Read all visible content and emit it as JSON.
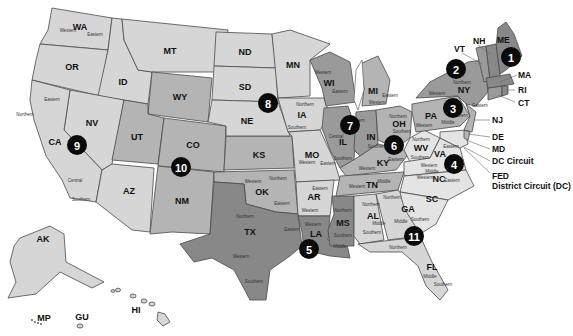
{
  "map": {
    "title": "United States Federal Judicial Circuits",
    "colors": {
      "light": "#d6d6d6",
      "mid": "#b4b4b4",
      "dark": "#9a9a9a",
      "darker": "#888888",
      "badge": "#0a0a0a",
      "background": "#ffffff"
    },
    "circuits": [
      {
        "number": "1",
        "states": [
          "ME",
          "NH",
          "MA",
          "RI"
        ]
      },
      {
        "number": "2",
        "states": [
          "VT",
          "NY",
          "CT"
        ]
      },
      {
        "number": "3",
        "states": [
          "PA",
          "NJ",
          "DE"
        ]
      },
      {
        "number": "4",
        "states": [
          "WV",
          "VA",
          "MD",
          "NC",
          "SC"
        ]
      },
      {
        "number": "5",
        "states": [
          "TX",
          "LA",
          "MS"
        ]
      },
      {
        "number": "6",
        "states": [
          "MI",
          "OH",
          "KY",
          "TN"
        ]
      },
      {
        "number": "7",
        "states": [
          "WI",
          "IL",
          "IN"
        ]
      },
      {
        "number": "8",
        "states": [
          "ND",
          "SD",
          "NE",
          "MN",
          "IA",
          "MO",
          "AR"
        ]
      },
      {
        "number": "9",
        "states": [
          "WA",
          "OR",
          "ID",
          "MT",
          "NV",
          "CA",
          "AZ",
          "AK",
          "HI",
          "GU",
          "MP"
        ]
      },
      {
        "number": "10",
        "states": [
          "WY",
          "UT",
          "CO",
          "KS",
          "OK",
          "NM"
        ]
      },
      {
        "number": "11",
        "states": [
          "AL",
          "GA",
          "FL"
        ]
      }
    ],
    "state_labels": {
      "WA": "WA",
      "OR": "OR",
      "ID": "ID",
      "MT": "MT",
      "WY": "WY",
      "NV": "NV",
      "CA": "CA",
      "UT": "UT",
      "CO": "CO",
      "AZ": "AZ",
      "NM": "NM",
      "ND": "ND",
      "SD": "SD",
      "NE": "NE",
      "KS": "KS",
      "OK": "OK",
      "TX": "TX",
      "MN": "MN",
      "IA": "IA",
      "MO": "MO",
      "AR": "AR",
      "LA": "LA",
      "WI": "WI",
      "IL": "IL",
      "MI": "MI",
      "IN": "IN",
      "OH": "OH",
      "KY": "KY",
      "TN": "TN",
      "MS": "MS",
      "AL": "AL",
      "GA": "GA",
      "FL": "FL",
      "SC": "SC",
      "NC": "NC",
      "VA": "VA",
      "WV": "WV",
      "PA": "PA",
      "NY": "NY",
      "AK": "AK",
      "HI": "HI",
      "GU": "GU",
      "MP": "MP"
    },
    "callouts": {
      "VT": "VT",
      "NH": "NH",
      "ME": "ME",
      "MA": "MA",
      "RI": "RI",
      "CT": "CT",
      "NJ": "NJ",
      "DE": "DE",
      "MD": "MD",
      "DC": "DC Circuit",
      "FED_line1": "FED",
      "FED_line2": "District Circuit (DC)"
    },
    "districts": {
      "western": "Western",
      "eastern": "Eastern",
      "northern": "Northern",
      "southern": "Southern",
      "central": "Central",
      "middle": "Middle"
    }
  }
}
